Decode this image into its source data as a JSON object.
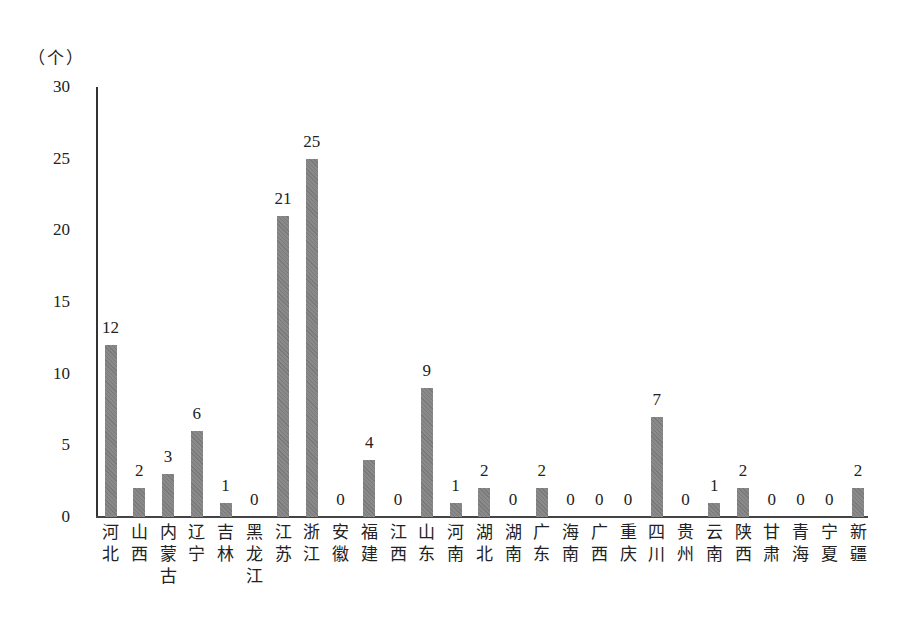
{
  "chart_data": {
    "type": "bar",
    "title": "",
    "xlabel": "",
    "ylabel": "（个）",
    "ylim": [
      0,
      30
    ],
    "yticks": [
      0,
      5,
      10,
      15,
      20,
      25,
      30
    ],
    "grid": false,
    "legend": null,
    "categories": [
      "河北",
      "山西",
      "内蒙古",
      "辽宁",
      "吉林",
      "黑龙江",
      "江苏",
      "浙江",
      "安徽",
      "福建",
      "江西",
      "山东",
      "河南",
      "湖北",
      "湖南",
      "广东",
      "海南",
      "广西",
      "重庆",
      "四川",
      "贵州",
      "云南",
      "陕西",
      "甘肃",
      "青海",
      "宁夏",
      "新疆"
    ],
    "values": [
      12,
      2,
      3,
      6,
      1,
      0,
      21,
      25,
      0,
      4,
      0,
      9,
      1,
      2,
      0,
      2,
      0,
      0,
      0,
      7,
      0,
      1,
      2,
      0,
      0,
      0,
      2
    ],
    "data_labels": true,
    "bar_color": "#8a8a8a"
  }
}
